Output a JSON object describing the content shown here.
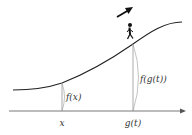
{
  "diagram": {
    "labels": {
      "x_point": "x",
      "gt_point": "g(t)",
      "f_of_x": "f(x)",
      "f_of_gt": "f(g(t))"
    },
    "icons": {
      "walker": "person-walking-icon",
      "direction": "arrow-up-right-icon"
    },
    "colors": {
      "curve": "#222222",
      "axis": "#555555",
      "lines": "#888888"
    }
  }
}
